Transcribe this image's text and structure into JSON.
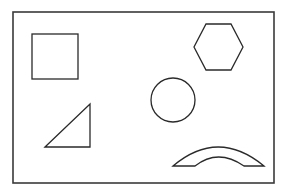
{
  "diagram": {
    "background": "#ffffff",
    "stroke_color": "#2a2a2a",
    "frame": {
      "x": 13,
      "y": 12,
      "width": 261,
      "height": 171
    },
    "shapes": [
      {
        "name": "square",
        "type": "rect",
        "x": 32,
        "y": 34,
        "width": 46,
        "height": 45
      },
      {
        "name": "hexagon",
        "type": "polygon",
        "points": "206,24 231,24 243,47 231,70 206,70 194,47"
      },
      {
        "name": "circle",
        "type": "circle",
        "cx": 173,
        "cy": 100,
        "r": 22
      },
      {
        "name": "right-triangle",
        "type": "polygon",
        "points": "45,147 90,104 90,147"
      },
      {
        "name": "arch",
        "type": "path",
        "d": "M173,166 Q218,128 264,166 L244,166 Q218,148 195,166 Z"
      }
    ]
  }
}
